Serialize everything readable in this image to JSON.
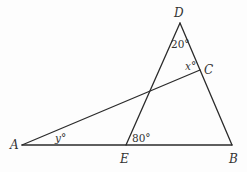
{
  "diagram": {
    "type": "geometry-figure",
    "stroke_color": "#2b2b2b",
    "points": [
      {
        "id": "A",
        "label": "A",
        "x": 22,
        "y": 145
      },
      {
        "id": "E",
        "label": "E",
        "x": 126,
        "y": 145
      },
      {
        "id": "B",
        "label": "B",
        "x": 232,
        "y": 145
      },
      {
        "id": "D",
        "label": "D",
        "x": 180,
        "y": 23
      },
      {
        "id": "C",
        "label": "C",
        "x": 200,
        "y": 70
      }
    ],
    "segments": [
      {
        "from": "A",
        "to": "B"
      },
      {
        "from": "E",
        "to": "D"
      },
      {
        "from": "D",
        "to": "B"
      },
      {
        "from": "A",
        "to": "C"
      }
    ],
    "angle_labels": [
      {
        "id": "angle-d",
        "text": "20°",
        "at": "D"
      },
      {
        "id": "angle-c",
        "text": "x°",
        "at": "C"
      },
      {
        "id": "angle-a",
        "text": "y°",
        "at": "A"
      },
      {
        "id": "angle-e",
        "text": "80°",
        "at": "E"
      }
    ]
  },
  "labels": {
    "A": "A",
    "B": "B",
    "C": "C",
    "D": "D",
    "E": "E",
    "angle_d": "20°",
    "angle_c_var": "x",
    "angle_a_var": "y",
    "angle_e": "80°",
    "degree": "°"
  }
}
